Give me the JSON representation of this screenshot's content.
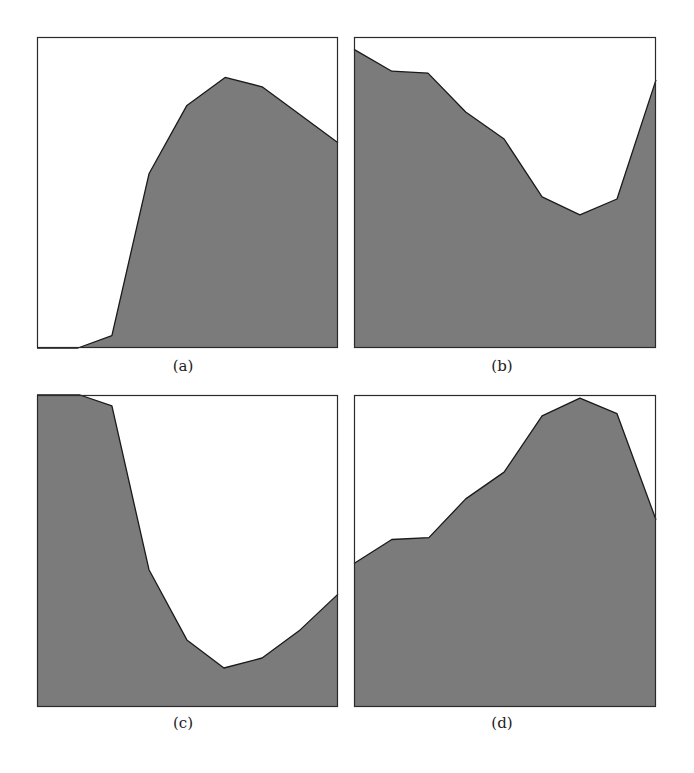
{
  "figure": {
    "fill_color": "#7b7b7b",
    "stroke_color": "#1a1a1a",
    "border_color": "#2a2a2a",
    "background": "#ffffff"
  },
  "panels": [
    {
      "id": "a",
      "caption": "(a)",
      "box": {
        "x": 37,
        "y": 37,
        "w": 301,
        "h": 311
      },
      "caption_pos": {
        "x": 158,
        "y": 357
      }
    },
    {
      "id": "b",
      "caption": "(b)",
      "box": {
        "x": 354,
        "y": 37,
        "w": 302,
        "h": 311
      },
      "caption_pos": {
        "x": 477,
        "y": 357
      }
    },
    {
      "id": "c",
      "caption": "(c)",
      "box": {
        "x": 37,
        "y": 395,
        "w": 301,
        "h": 312
      },
      "caption_pos": {
        "x": 158,
        "y": 714
      }
    },
    {
      "id": "d",
      "caption": "(d)",
      "box": {
        "x": 354,
        "y": 395,
        "w": 302,
        "h": 312
      },
      "caption_pos": {
        "x": 477,
        "y": 714
      }
    }
  ],
  "chart_data": [
    {
      "type": "area",
      "title": "(a)",
      "xlabel": "",
      "ylabel": "",
      "xlim": [
        0,
        1
      ],
      "ylim": [
        0,
        1
      ],
      "grid": false,
      "legend": null,
      "x": [
        0.0,
        0.136,
        0.249,
        0.372,
        0.498,
        0.625,
        0.748,
        0.874,
        1.0
      ],
      "values": [
        0.0,
        0.0,
        0.04,
        0.56,
        0.78,
        0.87,
        0.84,
        0.75,
        0.66
      ]
    },
    {
      "type": "area",
      "title": "(b)",
      "xlabel": "",
      "ylabel": "",
      "xlim": [
        0,
        1
      ],
      "ylim": [
        0,
        1
      ],
      "grid": false,
      "legend": null,
      "x": [
        0.0,
        0.125,
        0.245,
        0.37,
        0.497,
        0.623,
        0.748,
        0.871,
        1.0
      ],
      "values": [
        0.96,
        0.89,
        0.884,
        0.759,
        0.672,
        0.486,
        0.428,
        0.479,
        0.862
      ]
    },
    {
      "type": "area",
      "title": "(c)",
      "xlabel": "",
      "ylabel": "",
      "xlim": [
        0,
        1
      ],
      "ylim": [
        0,
        1
      ],
      "grid": false,
      "legend": null,
      "x": [
        0.0,
        0.143,
        0.249,
        0.372,
        0.498,
        0.621,
        0.748,
        0.874,
        1.0
      ],
      "values": [
        1.0,
        1.0,
        0.965,
        0.44,
        0.215,
        0.125,
        0.157,
        0.247,
        0.362
      ]
    },
    {
      "type": "area",
      "title": "(d)",
      "xlabel": "",
      "ylabel": "",
      "xlim": [
        0,
        1
      ],
      "ylim": [
        0,
        1
      ],
      "grid": false,
      "legend": null,
      "x": [
        0.0,
        0.125,
        0.248,
        0.37,
        0.497,
        0.623,
        0.748,
        0.871,
        1.0
      ],
      "values": [
        0.46,
        0.537,
        0.543,
        0.667,
        0.753,
        0.933,
        0.99,
        0.94,
        0.6
      ]
    }
  ]
}
